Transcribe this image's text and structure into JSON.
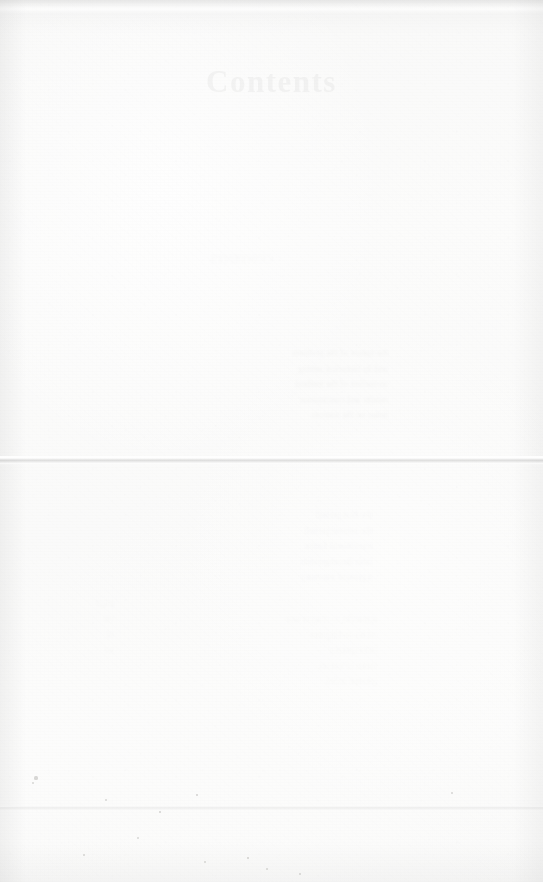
{
  "document": {
    "type": "scanned-book-page",
    "page_title": "Contents",
    "condition_note": "severely faded / overexposed scan",
    "background_color": "#f8f8f7",
    "ink_color": "#5c5c60"
  },
  "creases": [
    {
      "name": "main-fold",
      "y": 456,
      "prominence": "visible"
    },
    {
      "name": "lower-fold",
      "y": 806,
      "prominence": "faint"
    }
  ],
  "ghost_text": {
    "note": "mirrored show-through bleeding from the reverse side of the leaf",
    "title_line": "CONTENTS",
    "upper_lines": [
      "the nature of the problem",
      "and its historical setting",
      "an outline of the method",
      "results and conclusions",
      "notes on the sources"
    ],
    "mid_lines": [
      "the first period",
      "the second period",
      "transitional forms",
      "later developments",
      "a general summary"
    ],
    "lower_lines": [
      "appendix to chapter one",
      "tables and figures",
      "bibliography",
      "index of names",
      "general index"
    ],
    "left_lines": [
      "page",
      "vii",
      "xi",
      "xv"
    ]
  },
  "specks": [
    {
      "x": 36,
      "y": 778,
      "r": 1.6
    },
    {
      "x": 33,
      "y": 783,
      "r": 1.1
    },
    {
      "x": 106,
      "y": 800,
      "r": 1.0
    },
    {
      "x": 138,
      "y": 838,
      "r": 1.3
    },
    {
      "x": 84,
      "y": 855,
      "r": 0.9
    },
    {
      "x": 205,
      "y": 862,
      "r": 1.2
    },
    {
      "x": 267,
      "y": 869,
      "r": 1.0
    },
    {
      "x": 300,
      "y": 874,
      "r": 0.9
    },
    {
      "x": 160,
      "y": 812,
      "r": 0.8
    },
    {
      "x": 248,
      "y": 858,
      "r": 0.8
    },
    {
      "x": 452,
      "y": 793,
      "r": 0.9
    },
    {
      "x": 197,
      "y": 795,
      "r": 0.8
    }
  ]
}
